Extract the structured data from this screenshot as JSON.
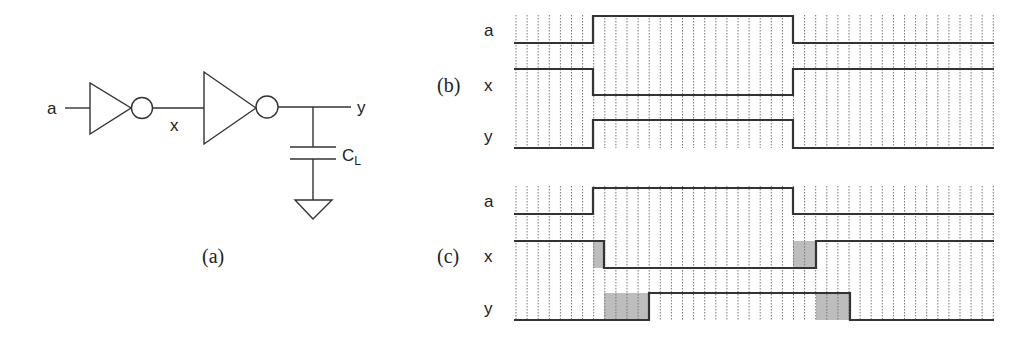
{
  "circuit": {
    "caption": "(a)",
    "input_label": "a",
    "node_label": "x",
    "output_label": "y",
    "cap_label_main": "C",
    "cap_label_sub": "L",
    "components": [
      {
        "type": "inverter",
        "size": "small",
        "input": "a",
        "output": "x"
      },
      {
        "type": "inverter",
        "size": "large",
        "input": "x",
        "output": "y"
      },
      {
        "type": "capacitor",
        "name": "CL",
        "from": "y",
        "to": "ground"
      },
      {
        "type": "ground"
      }
    ]
  },
  "timing_b": {
    "caption": "(b)",
    "description": "ideal (zero-delay) waveforms",
    "signals": [
      {
        "name": "a",
        "label": "a"
      },
      {
        "name": "x",
        "label": "x"
      },
      {
        "name": "y",
        "label": "y"
      }
    ]
  },
  "timing_c": {
    "caption": "(c)",
    "description": "waveforms with gate delays (shaded)",
    "signals": [
      {
        "name": "a",
        "label": "a"
      },
      {
        "name": "x",
        "label": "x"
      },
      {
        "name": "y",
        "label": "y"
      }
    ]
  },
  "colors": {
    "line": "#333333",
    "grid": "#777777",
    "delay_shade": "#bdbdbd",
    "background": "#ffffff"
  },
  "chart_data": [
    {
      "type": "line",
      "title": "(b)",
      "xlabel": "time",
      "ylabel": "",
      "grid": true,
      "series": [
        {
          "name": "a",
          "steps": [
            {
              "t": 0,
              "v": 0
            },
            {
              "t": 7,
              "v": 1
            },
            {
              "t": 25,
              "v": 0
            }
          ]
        },
        {
          "name": "x",
          "steps": [
            {
              "t": 0,
              "v": 1
            },
            {
              "t": 7,
              "v": 0
            },
            {
              "t": 25,
              "v": 1
            }
          ]
        },
        {
          "name": "y",
          "steps": [
            {
              "t": 0,
              "v": 0
            },
            {
              "t": 7,
              "v": 1
            },
            {
              "t": 25,
              "v": 0
            }
          ]
        }
      ]
    },
    {
      "type": "line",
      "title": "(c)",
      "xlabel": "time",
      "ylabel": "",
      "grid": true,
      "series": [
        {
          "name": "a",
          "steps": [
            {
              "t": 0,
              "v": 0
            },
            {
              "t": 7,
              "v": 1
            },
            {
              "t": 25,
              "v": 0
            }
          ]
        },
        {
          "name": "x",
          "steps": [
            {
              "t": 0,
              "v": 1
            },
            {
              "t": 8,
              "v": 0
            },
            {
              "t": 27,
              "v": 1
            }
          ],
          "delay_regions": [
            [
              7,
              8
            ],
            [
              25,
              27
            ]
          ]
        },
        {
          "name": "y",
          "steps": [
            {
              "t": 0,
              "v": 0
            },
            {
              "t": 12,
              "v": 1
            },
            {
              "t": 30,
              "v": 0
            }
          ],
          "delay_regions": [
            [
              8,
              12
            ],
            [
              27,
              30
            ]
          ]
        }
      ]
    }
  ]
}
